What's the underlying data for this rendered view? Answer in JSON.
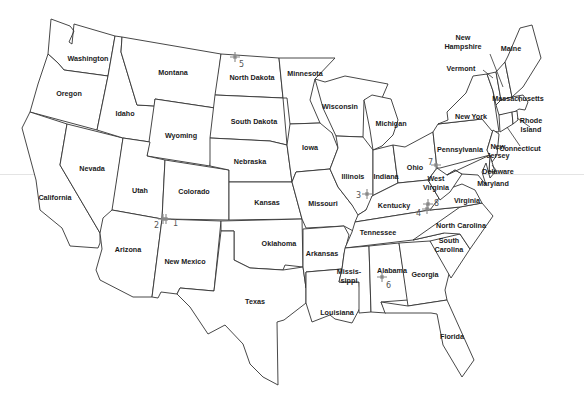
{
  "map": {
    "title": "United States",
    "states": [
      {
        "id": "washington",
        "label": "Washington",
        "x": 88,
        "y": 58
      },
      {
        "id": "oregon",
        "label": "Oregon",
        "x": 69,
        "y": 93
      },
      {
        "id": "california",
        "label": "California",
        "x": 55,
        "y": 197
      },
      {
        "id": "nevada",
        "label": "Nevada",
        "x": 92,
        "y": 168
      },
      {
        "id": "idaho",
        "label": "Idaho",
        "x": 125,
        "y": 113
      },
      {
        "id": "montana",
        "label": "Montana",
        "x": 173,
        "y": 72
      },
      {
        "id": "wyoming",
        "label": "Wyoming",
        "x": 181,
        "y": 135
      },
      {
        "id": "utah",
        "label": "Utah",
        "x": 140,
        "y": 190
      },
      {
        "id": "colorado",
        "label": "Colorado",
        "x": 194,
        "y": 191
      },
      {
        "id": "arizona",
        "label": "Arizona",
        "x": 128,
        "y": 249
      },
      {
        "id": "new-mexico",
        "label": "New Mexico",
        "x": 185,
        "y": 261
      },
      {
        "id": "north-dakota",
        "label": "North Dakota",
        "x": 252,
        "y": 77
      },
      {
        "id": "south-dakota",
        "label": "South Dakota",
        "x": 254,
        "y": 121
      },
      {
        "id": "nebraska",
        "label": "Nebraska",
        "x": 250,
        "y": 161
      },
      {
        "id": "kansas",
        "label": "Kansas",
        "x": 267,
        "y": 202
      },
      {
        "id": "oklahoma",
        "label": "Oklahoma",
        "x": 279,
        "y": 243
      },
      {
        "id": "texas",
        "label": "Texas",
        "x": 255,
        "y": 301
      },
      {
        "id": "minnesota",
        "label": "Minnesota",
        "x": 305,
        "y": 73
      },
      {
        "id": "iowa",
        "label": "Iowa",
        "x": 310,
        "y": 147
      },
      {
        "id": "missouri",
        "label": "Missouri",
        "x": 323,
        "y": 203
      },
      {
        "id": "arkansas",
        "label": "Arkansas",
        "x": 322,
        "y": 253
      },
      {
        "id": "louisiana",
        "label": "Louisiana",
        "x": 337,
        "y": 312
      },
      {
        "id": "wisconsin",
        "label": "Wisconsin",
        "x": 340,
        "y": 106
      },
      {
        "id": "illinois",
        "label": "Illinois",
        "x": 353,
        "y": 176
      },
      {
        "id": "michigan",
        "label": "Michigan",
        "x": 391,
        "y": 123
      },
      {
        "id": "indiana",
        "label": "Indiana",
        "x": 386,
        "y": 176
      },
      {
        "id": "ohio",
        "label": "Ohio",
        "x": 415,
        "y": 167
      },
      {
        "id": "kentucky",
        "label": "Kentucky",
        "x": 394,
        "y": 205
      },
      {
        "id": "tennessee",
        "label": "Tennessee",
        "x": 378,
        "y": 232
      },
      {
        "id": "mississippi",
        "label": "Missis-\nsippi",
        "x": 349,
        "y": 276
      },
      {
        "id": "alabama",
        "label": "Alabama",
        "x": 392,
        "y": 270
      },
      {
        "id": "georgia",
        "label": "Georgia",
        "x": 425,
        "y": 274
      },
      {
        "id": "florida",
        "label": "Florida",
        "x": 452,
        "y": 336
      },
      {
        "id": "south-carolina",
        "label": "South\nCarolina",
        "x": 449,
        "y": 245
      },
      {
        "id": "north-carolina",
        "label": "North Carolina",
        "x": 461,
        "y": 225
      },
      {
        "id": "virginia",
        "label": "Virginia",
        "x": 467,
        "y": 200
      },
      {
        "id": "west-virginia",
        "label": "West\nVirginia",
        "x": 436,
        "y": 183
      },
      {
        "id": "pennsylvania",
        "label": "Pennsylvania",
        "x": 460,
        "y": 149
      },
      {
        "id": "new-york",
        "label": "New York",
        "x": 471,
        "y": 116
      },
      {
        "id": "maryland",
        "label": "Maryland",
        "x": 493,
        "y": 183
      },
      {
        "id": "delaware",
        "label": "Delaware",
        "x": 498,
        "y": 171
      },
      {
        "id": "new-jersey",
        "label": "New\nJersey",
        "x": 498,
        "y": 151
      },
      {
        "id": "connecticut",
        "label": "Connecticut",
        "x": 520,
        "y": 148
      },
      {
        "id": "rhode-island",
        "label": "Rhode\nIsland",
        "x": 531,
        "y": 125
      },
      {
        "id": "massachusetts",
        "label": "Massachusetts",
        "x": 518,
        "y": 98
      },
      {
        "id": "vermont",
        "label": "Vermont",
        "x": 461,
        "y": 68
      },
      {
        "id": "new-hampshire",
        "label": "New\nHampshire",
        "x": 463,
        "y": 42
      },
      {
        "id": "maine",
        "label": "Maine",
        "x": 511,
        "y": 48
      }
    ],
    "markers": [
      {
        "id": "1",
        "label": "1",
        "x": 166,
        "y": 219,
        "lx": 173,
        "ly": 226
      },
      {
        "id": "2",
        "label": "2",
        "x": 163,
        "y": 219,
        "lx": 154,
        "ly": 228
      },
      {
        "id": "3",
        "label": "3",
        "x": 367,
        "y": 194,
        "lx": 356,
        "ly": 198
      },
      {
        "id": "4",
        "label": "4",
        "x": 427,
        "y": 209,
        "lx": 416,
        "ly": 216
      },
      {
        "id": "5",
        "label": "5",
        "x": 235,
        "y": 57,
        "lx": 239,
        "ly": 67
      },
      {
        "id": "6",
        "label": "6",
        "x": 382,
        "y": 277,
        "lx": 386,
        "ly": 288
      },
      {
        "id": "7",
        "label": "7",
        "x": 436,
        "y": 165,
        "lx": 428,
        "ly": 165
      },
      {
        "id": "8",
        "label": "8",
        "x": 428,
        "y": 204,
        "lx": 434,
        "ly": 206
      }
    ]
  }
}
